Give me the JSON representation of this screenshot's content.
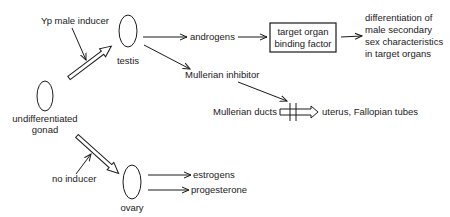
{
  "diagram": {
    "type": "flowchart",
    "topic": "sexual differentiation of the gonad",
    "nodes": {
      "undifferentiated_gonad": {
        "line1": "undifferentiated",
        "line2": "gonad"
      },
      "testis": {
        "label": "testis"
      },
      "ovary": {
        "label": "ovary"
      },
      "binding_factor_box": {
        "line1": "target organ",
        "line2": "binding factor"
      },
      "male_outcome": {
        "line1": "differentiation of",
        "line2": "male secondary",
        "line3": "sex characteristics",
        "line4": "in target organs"
      },
      "mullerian_ducts": {
        "label": "Mullerian ducts"
      },
      "uterus": {
        "label": "uterus, Fallopian tubes"
      }
    },
    "signals": {
      "male_inducer": "Yp male inducer",
      "no_inducer": "no inducer",
      "androgens": "androgens",
      "mullerian_inhibitor": "Mullerian inhibitor",
      "estrogens": "estrogens",
      "progesterone": "progesterone"
    },
    "edges": [
      {
        "from": "undifferentiated gonad",
        "to": "testis",
        "style": "hollow-arrow",
        "label": "Yp male inducer"
      },
      {
        "from": "undifferentiated gonad",
        "to": "ovary",
        "style": "hollow-arrow",
        "label": "no inducer"
      },
      {
        "from": "testis",
        "to": "androgens",
        "style": "arrow"
      },
      {
        "from": "androgens",
        "to": "target organ binding factor",
        "style": "arrow"
      },
      {
        "from": "target organ binding factor",
        "to": "differentiation of male secondary sex characteristics in target organs",
        "style": "arrow"
      },
      {
        "from": "testis",
        "to": "Mullerian inhibitor",
        "style": "arrow"
      },
      {
        "from": "Mullerian inhibitor",
        "to": "Mullerian ducts path",
        "style": "arrow",
        "effect": "blocks"
      },
      {
        "from": "Mullerian ducts",
        "to": "uterus, Fallopian tubes",
        "style": "hollow-arrow-blocked"
      },
      {
        "from": "ovary",
        "to": "estrogens",
        "style": "arrow"
      },
      {
        "from": "ovary",
        "to": "progesterone",
        "style": "arrow"
      }
    ]
  }
}
